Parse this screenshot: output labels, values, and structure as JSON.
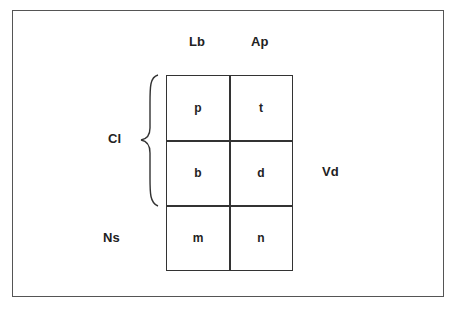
{
  "columns": [
    "Lb",
    "Ap"
  ],
  "rows": {
    "bracket_label": "Cl",
    "side_label_right": "Vd",
    "bottom_label": "Ns"
  },
  "cells": [
    [
      "p",
      "t"
    ],
    [
      "b",
      "d"
    ],
    [
      "m",
      "n"
    ]
  ]
}
